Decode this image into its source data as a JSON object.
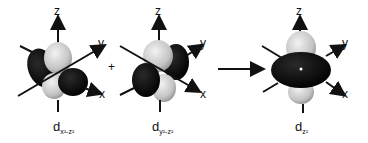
{
  "figure": {
    "panels": [
      {
        "id": "dx2z2",
        "label_main": "d",
        "label_sub": "x²-z²",
        "axes": {
          "z": "z",
          "y": "y",
          "x": "x"
        }
      },
      {
        "id": "dy2z2",
        "label_main": "d",
        "label_sub": "y²-z²",
        "axes": {
          "z": "z",
          "y": "y",
          "x": "x"
        }
      },
      {
        "id": "dz2",
        "label_main": "d",
        "label_sub": "z²",
        "axes": {
          "z": "z",
          "y": "y",
          "x": "x"
        }
      }
    ],
    "operator_plus": "+",
    "colors": {
      "light_lobe": "#cfcfcf",
      "dark_lobe": "#0a0a0a",
      "axis": "#111111"
    }
  }
}
